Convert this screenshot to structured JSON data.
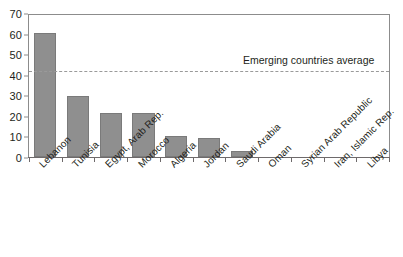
{
  "chart_data": {
    "type": "bar",
    "title": "",
    "subtitle": "",
    "xlabel": "",
    "ylabel": "",
    "ylim": [
      0,
      70
    ],
    "yticks": [
      0,
      10,
      20,
      30,
      40,
      50,
      60,
      70
    ],
    "grid": false,
    "legend_position": "none",
    "categories": [
      "Lebanon",
      "Tunisia",
      "Egypt, Arab Rep.",
      "Morocco",
      "Algeria",
      "Jordan",
      "Saudi Arabia",
      "Oman",
      "Syrian Arab Republic",
      "Iran, Islamic Rep.",
      "Libya"
    ],
    "values": [
      60.8,
      30.1,
      21.4,
      21.4,
      10.1,
      9.5,
      3.0,
      0,
      0,
      0,
      0
    ],
    "annotations": [
      {
        "name": "emerging-countries-average",
        "label": "Emerging countries average",
        "value": 42.3,
        "style": "dashed-horizontal-line"
      }
    ],
    "colors": {
      "bar_fill": "#8f8f8f",
      "bar_stroke": "#7a7a7a",
      "axis": "#6e6a6b",
      "frame": "#8c8c8c",
      "average_line": "#9a9a9a",
      "text": "#231f20",
      "background": "#ffffff"
    }
  }
}
